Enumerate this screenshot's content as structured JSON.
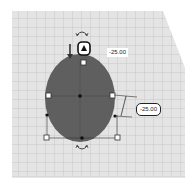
{
  "workplane": {
    "grid_color": "#b9b9b9",
    "plane_color": "#e6e6e6",
    "background": "#ffffff"
  },
  "shape": {
    "type": "ellipsoid",
    "fill": "#5c5c5c",
    "selected": true
  },
  "dimensions": {
    "top_value": "-25.00",
    "side_value": "-25.00"
  },
  "icons": {
    "rotate_top": "rotate-arrow-icon",
    "rotate_bottom": "rotate-arrow-icon",
    "lift_handle": "lift-cone-icon",
    "height_arrow": "height-arrow-icon"
  }
}
